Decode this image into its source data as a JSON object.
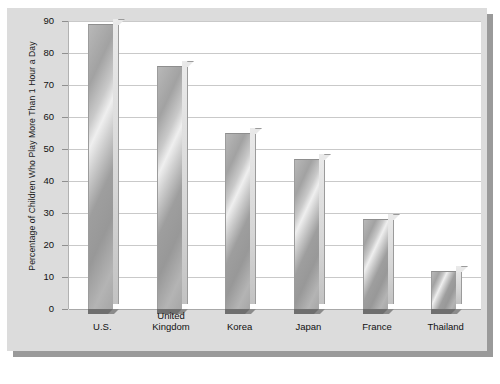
{
  "chart_data": {
    "type": "bar",
    "title": "",
    "xlabel": "",
    "ylabel": "Percentage of Children Who Play More Than 1 Hour a Day",
    "categories": [
      "U.S.",
      "United\nKingdom",
      "Korea",
      "Japan",
      "France",
      "Thailand"
    ],
    "values": [
      89,
      76,
      55,
      47,
      28,
      12
    ],
    "ylim": [
      0,
      90
    ],
    "yticks": [
      0,
      10,
      20,
      30,
      40,
      50,
      60,
      70,
      80,
      90
    ],
    "ytick_labels": [
      "0",
      "10",
      "20",
      "30",
      "40",
      "50",
      "60",
      "70",
      "80",
      "90"
    ],
    "grid": true,
    "legend": false,
    "legend_position": "none",
    "bar_style": "3d",
    "colors": {
      "bar_fill": "#b0b0b0",
      "bar_highlight": "#efefef",
      "bar_shadow": "#6f6f6f",
      "panel_background": "#dcdcdc",
      "plot_background": "#ffffff",
      "gridline": "#c9c9c9",
      "axis": "#b2b2b2",
      "text": "#111111",
      "figure_background": "#ffffff",
      "panel_drop_shadow": "#9a9a9a"
    }
  }
}
